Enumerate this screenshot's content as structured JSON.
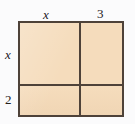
{
  "figure": {
    "type": "area-model-rectangle",
    "background_color": "#fbfbfc",
    "fill_color": "#f5dcbc",
    "line_color": "#4e4239"
  },
  "labels": {
    "top_left": "x",
    "top_right": "3",
    "left_upper": "x",
    "left_lower": "2"
  },
  "regions": {
    "top_left_cell": "",
    "top_right_cell": "",
    "bottom_left_cell": "",
    "bottom_right_cell": ""
  }
}
